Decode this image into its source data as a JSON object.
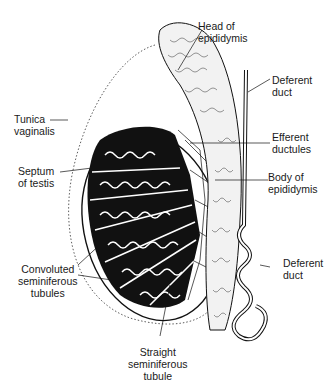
{
  "diagram": {
    "labels": {
      "head_of_epididymis": [
        "Head of",
        "epididymis"
      ],
      "deferent_duct_top": [
        "Deferent",
        "duct"
      ],
      "tunica_vaginalis": [
        "Tunica",
        "vaginalis"
      ],
      "efferent_ductules": [
        "Efferent",
        "ductules"
      ],
      "septum_of_testis": [
        "Septum",
        "of testis"
      ],
      "body_of_epididymis": [
        "Body of",
        "epididymis"
      ],
      "convoluted_seminiferous_tubules": [
        "Convoluted",
        "seminiferous",
        "tubules"
      ],
      "deferent_duct_bottom": [
        "Deferent",
        "duct"
      ],
      "straight_seminiferous_tubule": [
        "Straight",
        "seminiferous",
        "tubule"
      ]
    },
    "colors": {
      "ink": "#111111",
      "background": "#ffffff"
    }
  }
}
